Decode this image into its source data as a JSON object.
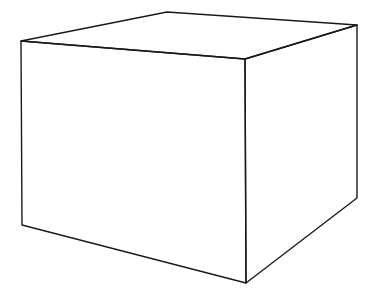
{
  "figure": {
    "background": "#ffffff",
    "stroke_color": "#1a1a1a",
    "stroke_width": 1.4,
    "vertices": {
      "top_left_front": [
        21,
        41
      ],
      "top_back": [
        167,
        12
      ],
      "top_right_back": [
        357,
        25
      ],
      "top_front_right": [
        245,
        59
      ],
      "bottom_left": [
        22,
        225
      ],
      "bottom_front": [
        246,
        283
      ],
      "bottom_right": [
        357,
        198
      ]
    },
    "faces": [
      {
        "name": "top-face",
        "points": [
          [
            21,
            41
          ],
          [
            167,
            12
          ],
          [
            357,
            25
          ],
          [
            245,
            59
          ]
        ]
      },
      {
        "name": "left-front-face",
        "points": [
          [
            21,
            41
          ],
          [
            245,
            59
          ],
          [
            246,
            283
          ],
          [
            22,
            225
          ]
        ]
      },
      {
        "name": "right-front-face",
        "points": [
          [
            245,
            59
          ],
          [
            357,
            25
          ],
          [
            357,
            198
          ],
          [
            246,
            283
          ]
        ]
      }
    ]
  }
}
